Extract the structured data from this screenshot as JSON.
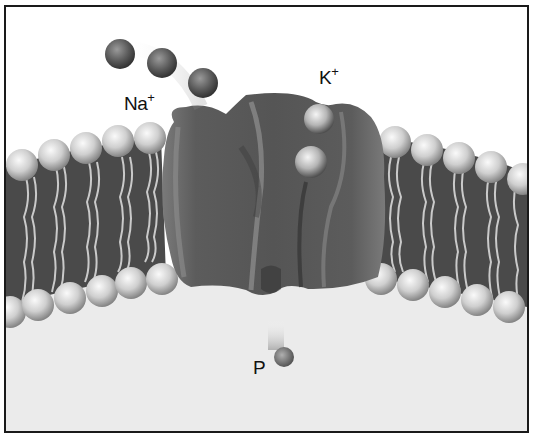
{
  "figure": {
    "labels": {
      "sodium": {
        "base": "Na",
        "charge": "+"
      },
      "potassium": {
        "base": "K",
        "charge": "+"
      },
      "phosphate": {
        "base": "P"
      }
    },
    "components": {
      "sodium_ions": 3,
      "potassium_ions": 2,
      "phosphate_groups": 1
    },
    "colors": {
      "border": "#1a1a1a",
      "extracellular": "#ffffff",
      "cytoplasm": "#ebebeb",
      "membrane_core": "#4a4a4a",
      "protein": "#5e5e5e",
      "head_light": "#f2f2f2",
      "head_dark": "#8a8a8a",
      "ion_dark": "#555555"
    }
  }
}
